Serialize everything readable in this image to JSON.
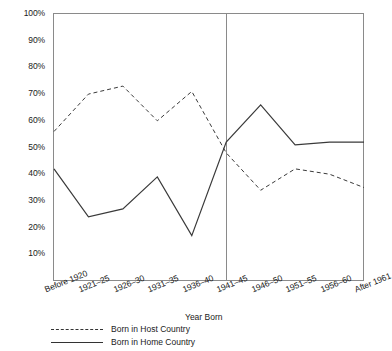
{
  "chart_data": {
    "type": "line",
    "title": "",
    "xlabel": "Year Born",
    "ylabel": "",
    "categories": [
      "Before 1920",
      "1921–25",
      "1926–30",
      "1931–35",
      "1936–40",
      "1941–45",
      "1946–50",
      "1951–55",
      "1956–60",
      "After 1961"
    ],
    "series": [
      {
        "name": "Born in Host Country",
        "style": "dashed",
        "color": "#3a3a3a",
        "values": [
          56,
          70,
          73,
          60,
          71,
          48,
          34,
          42,
          40,
          35
        ]
      },
      {
        "name": "Born in Home Country",
        "style": "solid",
        "color": "#3a3a3a",
        "values": [
          42,
          24,
          27,
          39,
          17,
          52,
          66,
          51,
          52,
          52
        ]
      }
    ],
    "ylim": [
      0,
      100
    ],
    "ytick_labels": [
      "10%",
      "20%",
      "30%",
      "40%",
      "50%",
      "60%",
      "70%",
      "80%",
      "90%",
      "100%"
    ],
    "ytick_values": [
      10,
      20,
      30,
      40,
      50,
      60,
      70,
      80,
      90,
      100
    ],
    "grid": false,
    "legend_position": "below-axis-left",
    "annotations": [
      {
        "name": "cohort-divider",
        "type": "vertical-line",
        "at_category": "1941–45",
        "description": "vertical separator drawn at the 1941–45 cohort"
      }
    ]
  },
  "legend": {
    "items": [
      {
        "label": "Born in Host Country",
        "style": "dashed"
      },
      {
        "label": "Born in Home Country",
        "style": "solid"
      }
    ]
  }
}
